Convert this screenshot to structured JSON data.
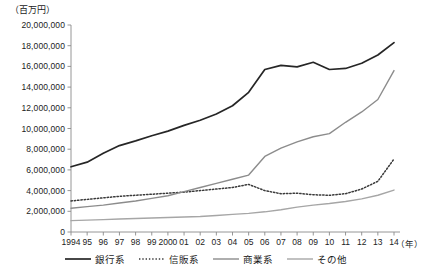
{
  "unit_label": "（百万円）",
  "xaxis_unit": "（年）",
  "legend": {
    "items": [
      {
        "label": "銀行系",
        "style": "solid",
        "color": "#262626",
        "width": 1.7
      },
      {
        "label": "信販系",
        "style": "dotted",
        "color": "#3a3a3a",
        "width": 1.5
      },
      {
        "label": "商業系",
        "style": "solid",
        "color": "#8c8c8c",
        "width": 1.4
      },
      {
        "label": "その他",
        "style": "solid",
        "color": "#a6a6a6",
        "width": 1.4
      }
    ]
  },
  "chart_data": {
    "type": "line",
    "title": "",
    "xlabel": "（年）",
    "ylabel": "（百万円）",
    "grid": false,
    "legend_position": "bottom",
    "xlim": [
      1994,
      2014
    ],
    "ylim": [
      0,
      20000000
    ],
    "ytick_step": 2000000,
    "ytick_labels": [
      "0",
      "2,000,000",
      "4,000,000",
      "6,000,000",
      "8,000,000",
      "10,000,000",
      "12,000,000",
      "14,000,000",
      "16,000,000",
      "18,000,000",
      "20,000,000"
    ],
    "ytick_values": [
      0,
      2000000,
      4000000,
      6000000,
      8000000,
      10000000,
      12000000,
      14000000,
      16000000,
      18000000,
      20000000
    ],
    "x": [
      1994,
      1995,
      1996,
      1997,
      1998,
      1999,
      2000,
      2001,
      2002,
      2003,
      2004,
      2005,
      2006,
      2007,
      2008,
      2009,
      2010,
      2011,
      2012,
      2013,
      2014
    ],
    "xtick_labels": [
      "1994",
      "95",
      "96",
      "97",
      "98",
      "99",
      "2000",
      "01",
      "02",
      "03",
      "04",
      "05",
      "06",
      "07",
      "08",
      "09",
      "10",
      "11",
      "12",
      "13",
      "14"
    ],
    "series": [
      {
        "name": "銀行系",
        "style": "solid",
        "color": "#262626",
        "width": 1.7,
        "values": [
          6300000,
          6750000,
          7600000,
          8350000,
          8800000,
          9300000,
          9750000,
          10300000,
          10800000,
          11400000,
          12200000,
          13500000,
          15700000,
          16100000,
          15950000,
          16400000,
          15700000,
          15800000,
          16300000,
          17100000,
          18300000
        ]
      },
      {
        "name": "信販系",
        "style": "dotted",
        "color": "#3a3a3a",
        "width": 1.5,
        "values": [
          3000000,
          3150000,
          3300000,
          3450000,
          3550000,
          3650000,
          3750000,
          3850000,
          4000000,
          4150000,
          4300000,
          4600000,
          4000000,
          3700000,
          3750000,
          3600000,
          3550000,
          3700000,
          4150000,
          4900000,
          7050000
        ]
      },
      {
        "name": "商業系",
        "style": "solid",
        "color": "#8c8c8c",
        "width": 1.4,
        "values": [
          2300000,
          2450000,
          2600000,
          2800000,
          3000000,
          3250000,
          3500000,
          3900000,
          4300000,
          4700000,
          5100000,
          5500000,
          7300000,
          8100000,
          8700000,
          9200000,
          9500000,
          10600000,
          11600000,
          12800000,
          15600000
        ]
      },
      {
        "name": "その他",
        "style": "solid",
        "color": "#a6a6a6",
        "width": 1.4,
        "values": [
          1100000,
          1150000,
          1200000,
          1250000,
          1300000,
          1350000,
          1400000,
          1450000,
          1500000,
          1600000,
          1700000,
          1800000,
          1950000,
          2150000,
          2400000,
          2600000,
          2750000,
          2950000,
          3200000,
          3550000,
          4050000
        ]
      }
    ]
  }
}
